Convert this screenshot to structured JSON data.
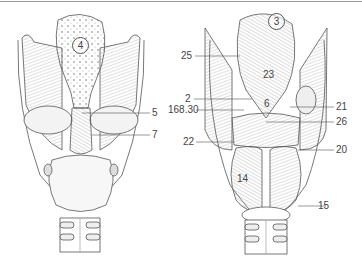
{
  "figure": {
    "left_view": {
      "region_label": "4",
      "callouts": [
        {
          "id": "5",
          "text": "5"
        },
        {
          "id": "7",
          "text": "7"
        }
      ]
    },
    "right_view": {
      "region_label": "3",
      "callouts": [
        {
          "id": "25",
          "text": "25"
        },
        {
          "id": "23",
          "text": "23"
        },
        {
          "id": "2",
          "text": "2"
        },
        {
          "id": "168.30",
          "text": "168.30"
        },
        {
          "id": "6",
          "text": "6"
        },
        {
          "id": "21",
          "text": "21"
        },
        {
          "id": "26",
          "text": "26"
        },
        {
          "id": "22",
          "text": "22"
        },
        {
          "id": "20",
          "text": "20"
        },
        {
          "id": "14",
          "text": "14"
        },
        {
          "id": "15",
          "text": "15"
        }
      ]
    }
  },
  "colors": {
    "line": "#555555",
    "shade": "#8a8a8a",
    "background": "#ffffff"
  }
}
